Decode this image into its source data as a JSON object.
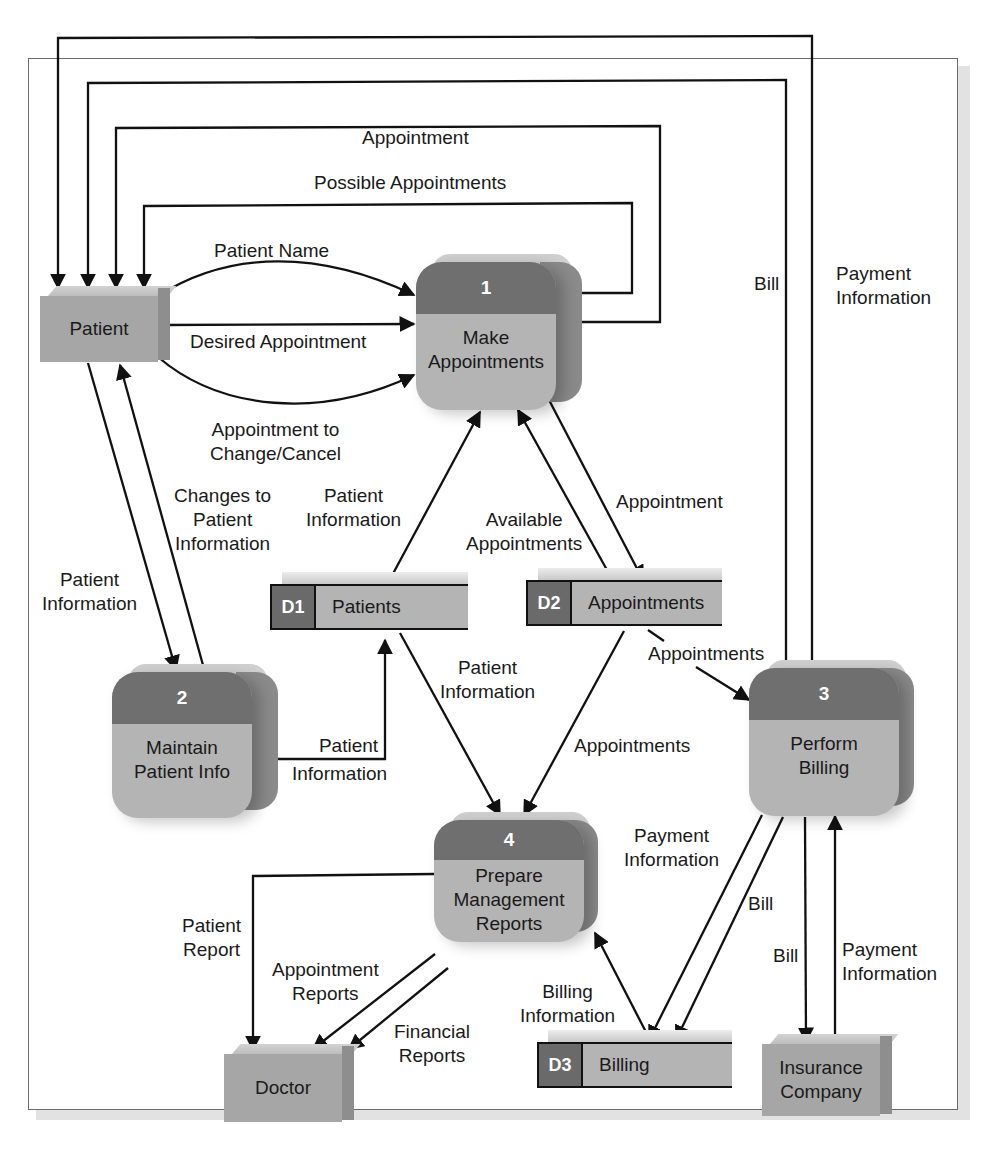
{
  "diagram": {
    "type": "data-flow-diagram",
    "entities": {
      "patient": "Patient",
      "doctor": "Doctor",
      "insurance": "Insurance Company"
    },
    "processes": [
      {
        "id": "1",
        "label": "Make Appointments"
      },
      {
        "id": "2",
        "label": "Maintain Patient Info"
      },
      {
        "id": "3",
        "label": "Perform Billing"
      },
      {
        "id": "4",
        "label": "Prepare Management Reports"
      }
    ],
    "process_lines": {
      "p1a": "Make",
      "p1b": "Appointments",
      "p2a": "Maintain",
      "p2b": "Patient Info",
      "p3a": "Perform",
      "p3b": "Billing",
      "p4a": "Prepare",
      "p4b": "Management",
      "p4c": "Reports"
    },
    "stores": [
      {
        "id": "D1",
        "label": "Patients"
      },
      {
        "id": "D2",
        "label": "Appointments"
      },
      {
        "id": "D3",
        "label": "Billing"
      }
    ],
    "flows": {
      "appointment_top": "Appointment",
      "possible_appointments": "Possible Appointments",
      "patient_name": "Patient Name",
      "desired_appointment": "Desired Appointment",
      "appt_change_1": "Appointment to",
      "appt_change_2": "Change/Cancel",
      "bill_top": "Bill",
      "payment_info_top_1": "Payment",
      "payment_info_top_2": "Information",
      "changes_1": "Changes to",
      "changes_2": "Patient",
      "changes_3": "Information",
      "pi_left_1": "Patient",
      "pi_left_2": "Information",
      "pi_d1_to_1_a": "Patient",
      "pi_d1_to_1_b": "Information",
      "available_1": "Available",
      "available_2": "Appointments",
      "appointment_to_d2": "Appointment",
      "appointments_d2_to_3": "Appointments",
      "pi_d1_to_4_a": "Patient",
      "pi_d1_to_4_b": "Information",
      "appointments_d2_to_4": "Appointments",
      "pi_2_to_d1_a": "Patient",
      "pi_2_to_d1_b": "Information",
      "payment_info_3_d3_a": "Payment",
      "payment_info_3_d3_b": "Information",
      "bill_3_d3": "Bill",
      "bill_3_ins": "Bill",
      "payment_ins_a": "Payment",
      "payment_ins_b": "Information",
      "patient_report_a": "Patient",
      "patient_report_b": "Report",
      "appt_reports_a": "Appointment",
      "appt_reports_b": "Reports",
      "financial_a": "Financial",
      "financial_b": "Reports",
      "billing_info_a": "Billing",
      "billing_info_b": "Information"
    }
  }
}
